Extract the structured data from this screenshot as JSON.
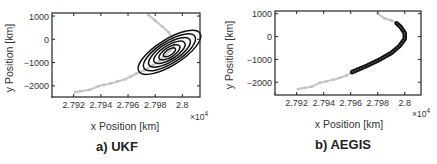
{
  "chart_data": [
    {
      "type": "scatter",
      "panel": "a",
      "caption": "a) UKF",
      "xlabel": "x Position [km]",
      "ylabel": "y Position [km]",
      "x_multiplier": "×10^4",
      "x_ticks": [
        2.792,
        2.794,
        2.796,
        2.798,
        2.8
      ],
      "x_tick_labels": [
        "2.792",
        "2.794",
        "2.796",
        "2.798",
        "2.8"
      ],
      "y_ticks": [
        1000,
        0,
        -1000,
        -2000
      ],
      "y_tick_labels": [
        "1000",
        "0",
        "−1000",
        "−2000"
      ],
      "xlim": [
        2.7904,
        2.8013
      ],
      "ylim": [
        -2480,
        1130
      ],
      "series": [
        {
          "name": "particles",
          "color": "#c0c0c0",
          "style": "markers",
          "points": [
            [
              2.7904,
              -2480
            ],
            [
              2.7921,
              -2270
            ],
            [
              2.7925,
              -2230
            ],
            [
              2.7932,
              -2170
            ],
            [
              2.7938,
              -2020
            ],
            [
              2.7942,
              -1960
            ],
            [
              2.7947,
              -1900
            ],
            [
              2.7952,
              -1820
            ],
            [
              2.7958,
              -1720
            ],
            [
              2.7962,
              -1600
            ],
            [
              2.7966,
              -1480
            ],
            [
              2.7972,
              -1330
            ],
            [
              2.7978,
              -1130
            ],
            [
              2.7983,
              -930
            ],
            [
              2.7987,
              -700
            ],
            [
              2.7991,
              -480
            ],
            [
              2.7994,
              -250
            ],
            [
              2.7993,
              -10
            ],
            [
              2.799,
              300
            ],
            [
              2.7985,
              560
            ],
            [
              2.798,
              800
            ],
            [
              2.7975,
              1050
            ]
          ]
        },
        {
          "name": "covariance ellipses",
          "color": "#111111",
          "style": "contours",
          "center": [
            2.79905,
            -560
          ],
          "angle_deg": -32,
          "radii_px": [
            [
              36,
              13
            ],
            [
              30,
              11
            ],
            [
              24,
              9
            ],
            [
              18,
              7
            ],
            [
              12,
              5
            ],
            [
              7,
              3
            ]
          ]
        }
      ],
      "grid": false
    },
    {
      "type": "scatter",
      "panel": "b",
      "caption": "b) AEGIS",
      "xlabel": "x Position [km]",
      "ylabel": "y Position [km]",
      "x_multiplier": "×10^4",
      "x_ticks": [
        2.792,
        2.794,
        2.796,
        2.798,
        2.8
      ],
      "x_tick_labels": [
        "2.792",
        "2.794",
        "2.796",
        "2.798",
        "2.8"
      ],
      "y_ticks": [
        1000,
        0,
        -1000,
        -2000
      ],
      "y_tick_labels": [
        "1000",
        "0",
        "−1000",
        "−2000"
      ],
      "xlim": [
        2.7904,
        2.8012
      ],
      "ylim": [
        -2560,
        1120
      ],
      "series": [
        {
          "name": "particles",
          "color": "#c0c0c0",
          "style": "markers",
          "points": [
            [
              2.7904,
              -2520
            ],
            [
              2.7921,
              -2300
            ],
            [
              2.7926,
              -2250
            ],
            [
              2.7931,
              -2200
            ],
            [
              2.7937,
              -2030
            ],
            [
              2.7942,
              -1960
            ],
            [
              2.7947,
              -1890
            ],
            [
              2.7952,
              -1810
            ],
            [
              2.7957,
              -1700
            ],
            [
              2.7961,
              -1580
            ],
            [
              2.798,
              1000
            ],
            [
              2.7985,
              800
            ],
            [
              2.799,
              700
            ],
            [
              2.7995,
              580
            ]
          ]
        },
        {
          "name": "AEGIS mixture",
          "color": "#111111",
          "style": "crescent",
          "path": [
            [
              2.7961,
              -1560
            ],
            [
              2.7972,
              -1280
            ],
            [
              2.7982,
              -990
            ],
            [
              2.799,
              -720
            ],
            [
              2.7996,
              -420
            ],
            [
              2.8,
              -100
            ],
            [
              2.8,
              150
            ],
            [
              2.7997,
              420
            ],
            [
              2.7994,
              580
            ]
          ]
        }
      ],
      "grid": false
    }
  ]
}
